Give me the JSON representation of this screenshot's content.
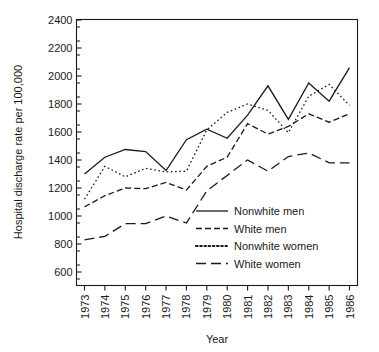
{
  "chart_data": {
    "type": "line",
    "title": "",
    "xlabel": "Year",
    "ylabel": "Hospital discharge rate per 100,000",
    "x": [
      1973,
      1974,
      1975,
      1976,
      1977,
      1978,
      1979,
      1980,
      1981,
      1982,
      1983,
      1984,
      1985,
      1986
    ],
    "categories": [
      "1973",
      "1974",
      "1975",
      "1976",
      "1977",
      "1978",
      "1979",
      "1980",
      "1981",
      "1982",
      "1983",
      "1984",
      "1985",
      "1986"
    ],
    "xlim": [
      1973,
      1986
    ],
    "ylim": [
      520,
      2400
    ],
    "ytick_labels": [
      "2400",
      "2200",
      "2000",
      "1800",
      "1600",
      "1400",
      "1200",
      "1000",
      "800",
      "600"
    ],
    "ytick_values": [
      2400,
      2200,
      2000,
      1800,
      1600,
      1400,
      1200,
      1000,
      800,
      600
    ],
    "yminor_step": 100,
    "grid": false,
    "legend_position": "lower-right-inside",
    "series": [
      {
        "name": "Nonwhite men",
        "style": "solid",
        "color": "#1a1a1a",
        "values": [
          1300,
          1420,
          1475,
          1460,
          1325,
          1545,
          1620,
          1555,
          1720,
          1930,
          1690,
          1950,
          1820,
          2060
        ]
      },
      {
        "name": "White men",
        "style": "dashed",
        "color": "#1a1a1a",
        "values": [
          1065,
          1145,
          1200,
          1195,
          1240,
          1185,
          1355,
          1420,
          1660,
          1585,
          1640,
          1730,
          1670,
          1730
        ]
      },
      {
        "name": "Nonwhite women",
        "style": "dotted",
        "color": "#1a1a1a",
        "values": [
          1120,
          1355,
          1280,
          1340,
          1315,
          1320,
          1615,
          1740,
          1800,
          1755,
          1595,
          1855,
          1940,
          1790
        ]
      },
      {
        "name": "White women",
        "style": "longdash",
        "color": "#1a1a1a",
        "values": [
          830,
          855,
          945,
          945,
          1000,
          950,
          1180,
          1290,
          1400,
          1320,
          1425,
          1450,
          1380,
          1380
        ]
      }
    ]
  },
  "legend": {
    "items": [
      {
        "label": "Nonwhite men",
        "style": "solid"
      },
      {
        "label": "White men",
        "style": "dashed"
      },
      {
        "label": "Nonwhite women",
        "style": "dotted"
      },
      {
        "label": "White women",
        "style": "longdash"
      }
    ]
  },
  "axes": {
    "x_title": "Year",
    "y_title": "Hospital discharge rate per 100,000"
  }
}
